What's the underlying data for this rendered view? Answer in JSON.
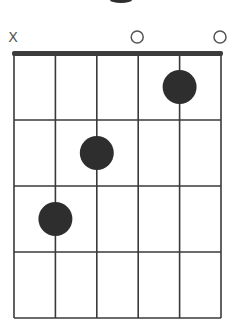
{
  "chord": {
    "name": "C",
    "string_count": 6,
    "fret_count": 4,
    "open_markers": [
      "X",
      "",
      "",
      "O",
      "",
      "O"
    ],
    "fingered": [
      {
        "string": 5,
        "fret": 1
      },
      {
        "string": 3,
        "fret": 2
      },
      {
        "string": 2,
        "fret": 3
      }
    ]
  },
  "colors": {
    "line": "#3a3a3a",
    "nut": "#3c3c3c",
    "dot": "#2e2e2e",
    "marker": "#555555",
    "background": "#ffffff"
  }
}
